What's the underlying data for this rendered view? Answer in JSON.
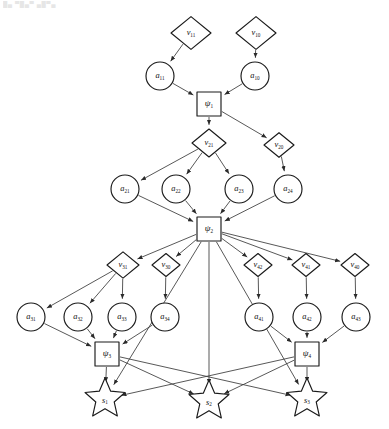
{
  "figure": {
    "artifact_text": "█▄ ▀█▄▀ ▄█▀▄",
    "colors": {
      "node_fill": "#ffffff",
      "node_stroke": "#1a1a1a",
      "edge_stroke": "#3a3a3a",
      "label_color": "#111111",
      "background": "#ffffff"
    },
    "shape_legend": [
      {
        "shape": "diamond",
        "role": "observation-variable",
        "prefix": "v"
      },
      {
        "shape": "circle",
        "role": "action-variable",
        "prefix": "a"
      },
      {
        "shape": "square",
        "role": "factor-node",
        "prefix": "psi"
      },
      {
        "shape": "star",
        "role": "state-node",
        "prefix": "s"
      }
    ]
  },
  "nodes": [
    {
      "id": "v11",
      "shape": "diamond",
      "base": "v",
      "sub": "11",
      "cx": 191,
      "cy": 33,
      "r": 20
    },
    {
      "id": "v10",
      "shape": "diamond",
      "base": "v",
      "sub": "10",
      "cx": 256,
      "cy": 33,
      "r": 20
    },
    {
      "id": "a11",
      "shape": "circle",
      "base": "a",
      "sub": "11",
      "cx": 160,
      "cy": 76,
      "r": 14
    },
    {
      "id": "a10",
      "shape": "circle",
      "base": "a",
      "sub": "10",
      "cx": 255,
      "cy": 76,
      "r": 14
    },
    {
      "id": "psi1",
      "shape": "square",
      "base": "ψ",
      "sub": "1",
      "cx": 209,
      "cy": 104,
      "r": 12
    },
    {
      "id": "v21",
      "shape": "diamond",
      "base": "v",
      "sub": "21",
      "cx": 209,
      "cy": 143,
      "r": 17
    },
    {
      "id": "v20",
      "shape": "diamond",
      "base": "v",
      "sub": "20",
      "cx": 279,
      "cy": 145,
      "r": 15
    },
    {
      "id": "a21",
      "shape": "circle",
      "base": "a",
      "sub": "21",
      "cx": 125,
      "cy": 189,
      "r": 14
    },
    {
      "id": "a22",
      "shape": "circle",
      "base": "a",
      "sub": "22",
      "cx": 176,
      "cy": 189,
      "r": 14
    },
    {
      "id": "a23",
      "shape": "circle",
      "base": "a",
      "sub": "23",
      "cx": 239,
      "cy": 189,
      "r": 14
    },
    {
      "id": "a24",
      "shape": "circle",
      "base": "a",
      "sub": "24",
      "cx": 288,
      "cy": 189,
      "r": 14
    },
    {
      "id": "psi2",
      "shape": "square",
      "base": "ψ",
      "sub": "2",
      "cx": 209,
      "cy": 229,
      "r": 12
    },
    {
      "id": "v31",
      "shape": "diamond",
      "base": "v",
      "sub": "31",
      "cx": 123,
      "cy": 265,
      "r": 16
    },
    {
      "id": "v30",
      "shape": "diamond",
      "base": "v",
      "sub": "30",
      "cx": 166,
      "cy": 265,
      "r": 14
    },
    {
      "id": "v42",
      "shape": "diamond",
      "base": "v",
      "sub": "42",
      "cx": 258,
      "cy": 265,
      "r": 14
    },
    {
      "id": "v41",
      "shape": "diamond",
      "base": "v",
      "sub": "41",
      "cx": 306,
      "cy": 265,
      "r": 14
    },
    {
      "id": "v40",
      "shape": "diamond",
      "base": "v",
      "sub": "40",
      "cx": 355,
      "cy": 265,
      "r": 14
    },
    {
      "id": "a31",
      "shape": "circle",
      "base": "a",
      "sub": "31",
      "cx": 31,
      "cy": 317,
      "r": 14
    },
    {
      "id": "a32",
      "shape": "circle",
      "base": "a",
      "sub": "32",
      "cx": 78,
      "cy": 317,
      "r": 14
    },
    {
      "id": "a33",
      "shape": "circle",
      "base": "a",
      "sub": "33",
      "cx": 122,
      "cy": 317,
      "r": 14
    },
    {
      "id": "a34",
      "shape": "circle",
      "base": "a",
      "sub": "34",
      "cx": 165,
      "cy": 317,
      "r": 14
    },
    {
      "id": "a41",
      "shape": "circle",
      "base": "a",
      "sub": "41",
      "cx": 259,
      "cy": 317,
      "r": 14
    },
    {
      "id": "a42",
      "shape": "circle",
      "base": "a",
      "sub": "42",
      "cx": 307,
      "cy": 317,
      "r": 14
    },
    {
      "id": "a43",
      "shape": "circle",
      "base": "a",
      "sub": "43",
      "cx": 356,
      "cy": 317,
      "r": 14
    },
    {
      "id": "psi3",
      "shape": "square",
      "base": "ψ",
      "sub": "3",
      "cx": 107,
      "cy": 354,
      "r": 12
    },
    {
      "id": "psi4",
      "shape": "square",
      "base": "ψ",
      "sub": "4",
      "cx": 307,
      "cy": 354,
      "r": 12
    },
    {
      "id": "s1",
      "shape": "star",
      "base": "s",
      "sub": "1",
      "cx": 105,
      "cy": 399,
      "r": 21
    },
    {
      "id": "s2",
      "shape": "star",
      "base": "s",
      "sub": "2",
      "cx": 209,
      "cy": 401,
      "r": 21
    },
    {
      "id": "s3",
      "shape": "star",
      "base": "s",
      "sub": "3",
      "cx": 307,
      "cy": 399,
      "r": 21
    }
  ],
  "edges": [
    {
      "from": "v11",
      "to": "a11"
    },
    {
      "from": "v10",
      "to": "a10"
    },
    {
      "from": "a11",
      "to": "psi1"
    },
    {
      "from": "a10",
      "to": "psi1"
    },
    {
      "from": "psi1",
      "to": "v21"
    },
    {
      "from": "psi1",
      "to": "v20"
    },
    {
      "from": "v21",
      "to": "a21"
    },
    {
      "from": "v21",
      "to": "a22"
    },
    {
      "from": "v21",
      "to": "a23"
    },
    {
      "from": "v20",
      "to": "a24"
    },
    {
      "from": "a21",
      "to": "psi2"
    },
    {
      "from": "a22",
      "to": "psi2"
    },
    {
      "from": "a23",
      "to": "psi2"
    },
    {
      "from": "a24",
      "to": "psi2"
    },
    {
      "from": "psi2",
      "to": "v31"
    },
    {
      "from": "psi2",
      "to": "v30"
    },
    {
      "from": "psi2",
      "to": "v42"
    },
    {
      "from": "psi2",
      "to": "v41"
    },
    {
      "from": "psi2",
      "to": "v40"
    },
    {
      "from": "v31",
      "to": "a31"
    },
    {
      "from": "v31",
      "to": "a32"
    },
    {
      "from": "v31",
      "to": "a33"
    },
    {
      "from": "v30",
      "to": "a34"
    },
    {
      "from": "v42",
      "to": "a41"
    },
    {
      "from": "v41",
      "to": "a42"
    },
    {
      "from": "v40",
      "to": "a43"
    },
    {
      "from": "a31",
      "to": "psi3"
    },
    {
      "from": "a32",
      "to": "psi3"
    },
    {
      "from": "a33",
      "to": "psi3"
    },
    {
      "from": "a34",
      "to": "psi3"
    },
    {
      "from": "a41",
      "to": "psi4"
    },
    {
      "from": "a42",
      "to": "psi4"
    },
    {
      "from": "a43",
      "to": "psi4"
    },
    {
      "from": "psi2",
      "to": "s2"
    },
    {
      "from": "psi2",
      "to": "s1"
    },
    {
      "from": "psi2",
      "to": "s3"
    },
    {
      "from": "psi3",
      "to": "s1"
    },
    {
      "from": "psi3",
      "to": "s2"
    },
    {
      "from": "psi3",
      "to": "s3"
    },
    {
      "from": "psi4",
      "to": "s1"
    },
    {
      "from": "psi4",
      "to": "s2"
    },
    {
      "from": "psi4",
      "to": "s3"
    }
  ]
}
